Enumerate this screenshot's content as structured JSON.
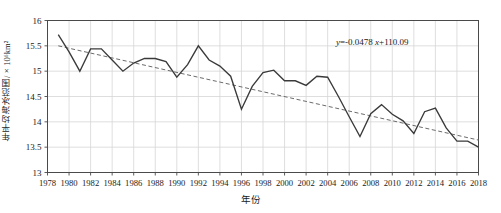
{
  "chart_data": {
    "type": "line",
    "title": "",
    "xlabel": "年份",
    "ylabel": "年平均海冰范围/×10⁶km²",
    "xlim": [
      1978,
      2018
    ],
    "ylim": [
      13,
      16
    ],
    "grid": true,
    "legend": null,
    "xticks": [
      1978,
      1980,
      1982,
      1984,
      1986,
      1988,
      1990,
      1992,
      1994,
      1996,
      1998,
      2000,
      2002,
      2004,
      2006,
      2008,
      2010,
      2012,
      2014,
      2016,
      2018
    ],
    "yticks": [
      13,
      13.5,
      14,
      14.5,
      15,
      15.5,
      16
    ],
    "x": [
      1979,
      1980,
      1981,
      1982,
      1983,
      1984,
      1985,
      1986,
      1987,
      1988,
      1989,
      1990,
      1991,
      1992,
      1993,
      1994,
      1995,
      1996,
      1997,
      1998,
      1999,
      2000,
      2001,
      2002,
      2003,
      2004,
      2005,
      2006,
      2007,
      2008,
      2009,
      2010,
      2011,
      2012,
      2013,
      2014,
      2015,
      2016,
      2017,
      2018
    ],
    "series": [
      {
        "name": "年平均海冰范围",
        "style": "solid",
        "color": "#3a3a3a",
        "values": [
          15.72,
          15.38,
          15.0,
          15.44,
          15.44,
          15.22,
          15.0,
          15.16,
          15.25,
          15.25,
          15.19,
          14.88,
          15.13,
          15.5,
          15.22,
          15.1,
          14.9,
          14.25,
          14.7,
          14.97,
          15.02,
          14.81,
          14.81,
          14.72,
          14.9,
          14.88,
          14.5,
          14.1,
          13.71,
          14.16,
          14.34,
          14.15,
          14.02,
          13.77,
          14.2,
          14.27,
          13.88,
          13.62,
          13.62,
          13.5
        ]
      },
      {
        "name": "线性趋势线",
        "style": "dashed",
        "color": "#6b6b6b",
        "equation": "y=-0.0478 x+110.09",
        "slope": -0.0478,
        "intercept": 110.09,
        "endpoints": [
          [
            1979,
            15.5
          ],
          [
            2018,
            13.64
          ]
        ]
      }
    ],
    "annotations": [
      {
        "text": "y=-0.0478 x+110.09",
        "x": 2006,
        "y": 15.55
      }
    ]
  },
  "annotation": {
    "y_symbol": "y",
    "equation_body": "=-0.0478 ",
    "x_symbol": "x",
    "equation_tail": "+110.09"
  },
  "colors": {
    "data_line": "#3a3a3a",
    "trend_line": "#6b6b6b",
    "grid": "#d6d6d6",
    "axis": "#4a4a4a",
    "text": "#1a1a1a",
    "background": "#ffffff"
  }
}
